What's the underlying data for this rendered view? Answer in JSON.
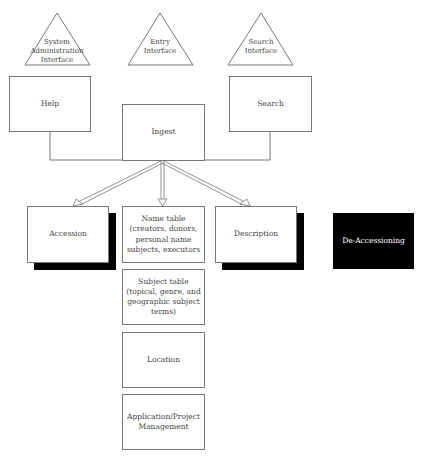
{
  "diagram": {
    "interfaces": [
      {
        "id": "system-admin",
        "label": "System Administration Interface",
        "lines": [
          "System",
          "Administration",
          "Interface"
        ]
      },
      {
        "id": "entry",
        "label": "Entry Interface",
        "lines": [
          "Entry",
          "Interface"
        ]
      },
      {
        "id": "search",
        "label": "Search Interface",
        "lines": [
          "Search",
          "Interface"
        ]
      }
    ],
    "modules": {
      "help": "Help",
      "search": "Search",
      "ingest": "Ingest",
      "accession": "Accession",
      "name_table": "Name table (creators, donors, personal name subjects, executors",
      "description": "Description",
      "de_accessioning": "De-Accessioning",
      "subject_table": "Subject table (topical, genre, and geographic subject terms)",
      "location": "Location",
      "app_project": "Application/Project Management"
    },
    "connections": [
      {
        "from": "help",
        "to": "ingest",
        "type": "line"
      },
      {
        "from": "search",
        "to": "ingest",
        "type": "line"
      },
      {
        "from": "ingest",
        "to": "accession",
        "type": "hollow-arrow"
      },
      {
        "from": "ingest",
        "to": "name_table",
        "type": "hollow-arrow"
      },
      {
        "from": "ingest",
        "to": "description",
        "type": "hollow-arrow"
      }
    ],
    "colors": {
      "line": "#777777",
      "shadow": "#000000",
      "dark_fill": "#000000"
    }
  }
}
